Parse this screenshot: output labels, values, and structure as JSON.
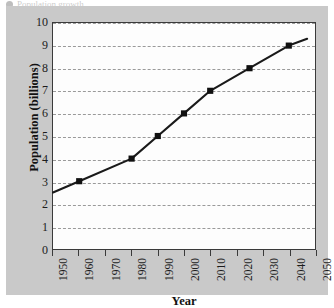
{
  "figure": {
    "caption_fragment": "Population growth",
    "panel_color": "#c9c9c9",
    "plot_background": "#fdfdfd",
    "frame_color": "#3a3a3a"
  },
  "chart_data": {
    "type": "line",
    "title": "",
    "xlabel": "Year",
    "ylabel": "Population (billions)",
    "xlim": [
      1950,
      2050
    ],
    "ylim": [
      0,
      10
    ],
    "grid": true,
    "grid_axis": "y",
    "legend": false,
    "line_color": "#1a1a1a",
    "marker": "square",
    "marker_color": "#101010",
    "xticks": [
      1950,
      1960,
      1970,
      1980,
      1990,
      2000,
      2010,
      2020,
      2030,
      2040,
      2050
    ],
    "xtick_labels": [
      "1950",
      "1960",
      "1970",
      "1980",
      "1990",
      "2000",
      "2010",
      "2020",
      "2030",
      "2040",
      "2050"
    ],
    "yticks": [
      0,
      1,
      2,
      3,
      4,
      5,
      6,
      7,
      8,
      9,
      10
    ],
    "ytick_labels": [
      "0",
      "1",
      "2",
      "3",
      "4",
      "5",
      "6",
      "7",
      "8",
      "9",
      "10"
    ],
    "x": [
      1950,
      1960,
      1980,
      1990,
      2000,
      2010,
      2025,
      2040,
      2047
    ],
    "y": [
      2.5,
      3.0,
      4.0,
      5.0,
      6.0,
      7.0,
      8.0,
      9.0,
      9.3
    ],
    "markers_x": [
      1960,
      1980,
      1990,
      2000,
      2010,
      2025,
      2040
    ],
    "markers_y": [
      3.0,
      4.0,
      5.0,
      6.0,
      7.0,
      8.0,
      9.0
    ]
  }
}
